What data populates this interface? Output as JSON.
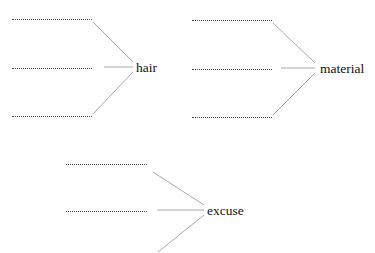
{
  "diagrams": [
    {
      "word": "hair",
      "blanks": 3
    },
    {
      "word": "material",
      "blanks": 3
    },
    {
      "word": "excuse",
      "blanks": 2
    }
  ],
  "blank_placeholder": "......................",
  "colors": {
    "line": "#aaaaaa",
    "dots": "#555555",
    "text": "#111111"
  }
}
